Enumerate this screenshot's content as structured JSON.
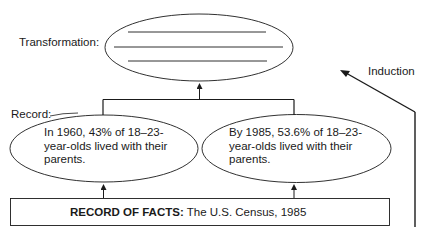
{
  "diagram": {
    "transformation": {
      "label": "Transformation:",
      "blank_lines": 3
    },
    "induction": {
      "label": "Induction"
    },
    "record": {
      "label": "Record:",
      "items": [
        {
          "lines": [
            "In 1960, 43% of 18–23-",
            "year-olds lived with their",
            "parents."
          ]
        },
        {
          "lines": [
            "By 1985, 53.6% of 18–23-",
            "year-olds lived with their",
            "parents."
          ]
        }
      ]
    },
    "record_of_facts": {
      "label": "RECORD OF FACTS:",
      "source": "The U.S. Census, 1985"
    },
    "colors": {
      "stroke": "#1a1a1a",
      "background": "#ffffff"
    }
  }
}
